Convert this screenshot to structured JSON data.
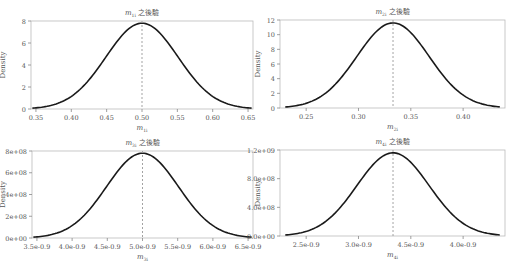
{
  "chart_data": [
    {
      "type": "line",
      "title": "m_{1i} 之後驗",
      "title_main": "m",
      "title_sub": "1i",
      "title_suffix": "之後驗",
      "xlabel": "m_{1i}",
      "xlabel_main": "m",
      "xlabel_sub": "1i",
      "ylabel": "Density",
      "xlim": [
        0.343,
        0.657
      ],
      "ylim": [
        0,
        8
      ],
      "x_ticks": [
        0.35,
        0.4,
        0.45,
        0.5,
        0.55,
        0.6,
        0.65
      ],
      "x_tick_labels": [
        "0.35",
        "0.40",
        "0.45",
        "0.50",
        "0.55",
        "0.60",
        "0.65"
      ],
      "y_ticks": [
        0,
        2,
        4,
        6,
        8
      ],
      "y_tick_labels": [
        "0",
        "2",
        "4",
        "6",
        "8"
      ],
      "mean": 0.5,
      "sd": 0.051,
      "peak_density": 7.8,
      "vline_x": 0.5,
      "x": [
        0.345,
        0.4,
        0.45,
        0.5,
        0.55,
        0.6,
        0.655
      ],
      "values": [
        0.1,
        1.1,
        4.9,
        7.8,
        4.9,
        1.1,
        0.1
      ]
    },
    {
      "type": "line",
      "title": "m_{2i} 之後驗",
      "title_main": "m",
      "title_sub": "2i",
      "title_suffix": "之後驗",
      "xlabel": "m_{2i}",
      "xlabel_main": "m",
      "xlabel_sub": "2i",
      "ylabel": "Density",
      "xlim": [
        0.225,
        0.44
      ],
      "ylim": [
        0,
        12
      ],
      "x_ticks": [
        0.25,
        0.3,
        0.35,
        0.4
      ],
      "x_tick_labels": [
        "0.25",
        "0.30",
        "0.35",
        "0.40"
      ],
      "y_ticks": [
        0,
        2,
        4,
        6,
        8,
        10,
        12
      ],
      "y_tick_labels": [
        "0",
        "2",
        "4",
        "6",
        "8",
        "10",
        "12"
      ],
      "mean": 0.333,
      "sd": 0.0345,
      "peak_density": 11.6,
      "vline_x": 0.333,
      "x": [
        0.23,
        0.25,
        0.3,
        0.333,
        0.35,
        0.4,
        0.435
      ],
      "values": [
        0.2,
        0.6,
        7.1,
        11.6,
        10.0,
        1.7,
        0.3
      ]
    },
    {
      "type": "line",
      "title": "m_{3i} 之後驗",
      "title_main": "m",
      "title_sub": "3i",
      "title_suffix": "之後驗",
      "xlabel": "m_{3i}",
      "xlabel_main": "m",
      "xlabel_sub": "3i",
      "ylabel": "Density",
      "xlim": [
        3.43e-09,
        6.57e-09
      ],
      "ylim": [
        0,
        800000000.0
      ],
      "x_ticks": [
        3.5e-09,
        4e-09,
        4.5e-09,
        5e-09,
        5.5e-09,
        6e-09,
        6.5e-09
      ],
      "x_tick_labels": [
        "3.5e-0.9",
        "4.0e-0.9",
        "4.5e-0.9",
        "5.0e-0.9",
        "5.5e-0.9",
        "6.0e-0.9",
        "6.5e-0.9"
      ],
      "y_ticks": [
        0,
        200000000.0,
        400000000.0,
        600000000.0,
        800000000.0
      ],
      "y_tick_labels": [
        "0e+00",
        "2e+08",
        "4e+08",
        "6e+08",
        "8e+08"
      ],
      "mean": 5e-09,
      "sd": 5.1e-10,
      "peak_density": 780000000.0,
      "vline_x": 5e-09,
      "x": [
        3.45e-09,
        4e-09,
        4.5e-09,
        5e-09,
        5.5e-09,
        6e-09,
        6.55e-09
      ],
      "values": [
        10000000.0,
        110000000.0,
        490000000.0,
        780000000.0,
        490000000.0,
        110000000.0,
        10000000.0
      ]
    },
    {
      "type": "line",
      "title": "m_{4i} 之後驗",
      "title_main": "m",
      "title_sub": "4i",
      "title_suffix": "之後驗",
      "xlabel": "m_{4i}",
      "xlabel_main": "m",
      "xlabel_sub": "4i",
      "ylabel": "Density",
      "xlim": [
        2.25e-09,
        4.4e-09
      ],
      "ylim": [
        0,
        1200000000.0
      ],
      "x_ticks": [
        2.5e-09,
        3e-09,
        3.5e-09,
        4e-09
      ],
      "x_tick_labels": [
        "2.5e-0.9",
        "3.0e-0.9",
        "4.5e-0.9",
        "4.0e-0.9"
      ],
      "y_ticks": [
        0,
        400000000.0,
        800000000.0,
        1200000000.0
      ],
      "y_tick_labels": [
        "0.0e+00",
        "4.0e+08",
        "8.0e+08",
        "1.2e+09"
      ],
      "mean": 3.33e-09,
      "sd": 3.45e-10,
      "peak_density": 1160000000.0,
      "vline_x": 3.33e-09,
      "x": [
        2.3e-09,
        2.5e-09,
        3e-09,
        3.33e-09,
        3.5e-09,
        4e-09,
        4.35e-09
      ],
      "values": [
        20000000.0,
        60000000.0,
        710000000.0,
        1160000000.0,
        1000000000.0,
        170000000.0,
        30000000.0
      ]
    }
  ],
  "layout": {
    "line_color": "#1a1a1a",
    "vline_color": "#999999",
    "axis_color": "#bbbbbb",
    "text_color": "#555555"
  }
}
